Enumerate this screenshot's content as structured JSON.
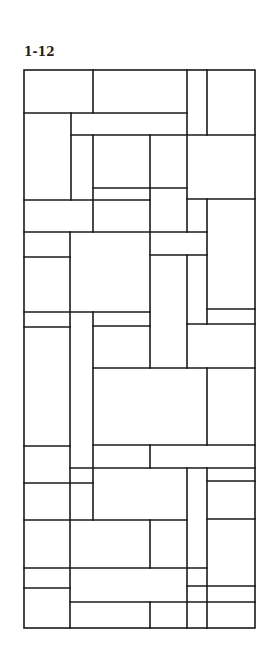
{
  "figure": {
    "label": "1-12",
    "stroke_color": "#1a1a1a",
    "frame": {
      "x": 24,
      "y": 70,
      "width": 231,
      "height": 558
    },
    "horizontal_lines": [
      [
        24,
        113,
        187,
        113
      ],
      [
        71,
        135,
        255,
        135
      ],
      [
        93,
        188,
        187,
        188
      ],
      [
        187,
        199,
        255,
        199
      ],
      [
        24,
        200,
        150,
        200
      ],
      [
        24,
        232,
        207,
        232
      ],
      [
        150,
        255,
        207,
        255
      ],
      [
        24,
        257,
        70,
        257
      ],
      [
        207,
        309,
        255,
        309
      ],
      [
        24,
        312,
        150,
        312
      ],
      [
        187,
        324,
        255,
        324
      ],
      [
        24,
        327,
        70,
        327
      ],
      [
        93,
        326,
        150,
        326
      ],
      [
        93,
        368,
        255,
        368
      ],
      [
        93,
        445,
        255,
        445
      ],
      [
        24,
        446,
        70,
        446
      ],
      [
        70,
        468,
        255,
        468
      ],
      [
        207,
        481,
        255,
        481
      ],
      [
        24,
        483,
        93,
        483
      ],
      [
        24,
        520,
        187,
        520
      ],
      [
        207,
        519,
        255,
        519
      ],
      [
        24,
        568,
        207,
        568
      ],
      [
        187,
        586,
        255,
        586
      ],
      [
        24,
        588,
        70,
        588
      ],
      [
        70,
        602,
        255,
        602
      ]
    ],
    "vertical_lines": [
      [
        93,
        70,
        93,
        113
      ],
      [
        187,
        70,
        187,
        232
      ],
      [
        207,
        70,
        207,
        135
      ],
      [
        71,
        113,
        71,
        200
      ],
      [
        93,
        135,
        93,
        232
      ],
      [
        150,
        135,
        150,
        368
      ],
      [
        207,
        199,
        207,
        324
      ],
      [
        187,
        255,
        187,
        368
      ],
      [
        70,
        232,
        70,
        628
      ],
      [
        93,
        312,
        93,
        520
      ],
      [
        207,
        368,
        207,
        445
      ],
      [
        150,
        445,
        150,
        468
      ],
      [
        187,
        468,
        187,
        628
      ],
      [
        207,
        468,
        207,
        628
      ],
      [
        150,
        520,
        150,
        568
      ],
      [
        150,
        602,
        150,
        628
      ]
    ]
  }
}
